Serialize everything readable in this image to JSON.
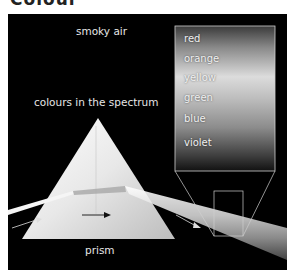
{
  "title": "Colour",
  "labels": {
    "smoky_air": "smoky air",
    "colours_in_spectrum": "colours in the spectrum",
    "prism": "prism"
  },
  "spectrum_colours": [
    "red",
    "orange",
    "yellow",
    "green",
    "blue",
    "violet"
  ],
  "colors": {
    "background": "#000000",
    "label_text": "#e6e6e6",
    "outline": "#cfcfcf"
  }
}
